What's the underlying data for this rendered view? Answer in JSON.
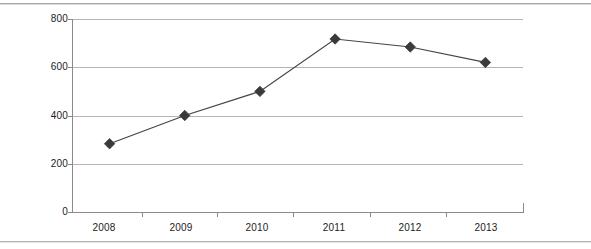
{
  "chart_data": {
    "type": "line",
    "title": "",
    "subtitle": "",
    "xlabel": "",
    "ylabel": "",
    "categories": [
      "2008",
      "2009",
      "2010",
      "2011",
      "2012",
      "2013"
    ],
    "series": [
      {
        "name": "Series 1",
        "values": [
          283,
          400,
          500,
          717,
          684,
          620
        ],
        "marker": "diamond",
        "color": "#444444"
      }
    ],
    "ylim": [
      0,
      800
    ],
    "yticks": [
      0,
      200,
      400,
      600,
      800
    ],
    "ytick_labels": [
      "0",
      "200",
      "400",
      "600",
      "800"
    ],
    "grid": true,
    "grid_axis": "y",
    "legend": false,
    "legend_position": "none"
  },
  "chart": {
    "y_axis": {
      "labels": [
        "800",
        "600",
        "400",
        "200",
        "0"
      ]
    },
    "x_axis": {
      "labels": [
        "2008",
        "2009",
        "2010",
        "2011",
        "2012",
        "2013"
      ]
    }
  },
  "colors": {
    "series_line": "#444444",
    "marker_fill": "#3a3a3a",
    "gridline": "#b4b4b4",
    "axis": "#8a8a8a",
    "text": "#1c1c1c",
    "background": "#ffffff",
    "scan_rule": "#9a9a9a"
  }
}
